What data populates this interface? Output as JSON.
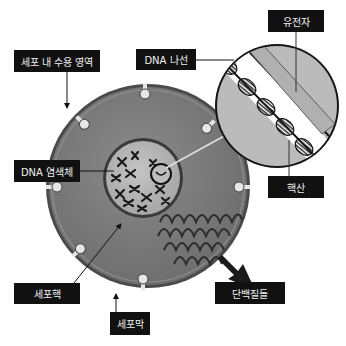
{
  "diagram": {
    "type": "cell-structure-illustration",
    "language": "ko",
    "colors": {
      "background": "#ffffff",
      "cytoplasm": "#7a7a7a",
      "membrane": "#555555",
      "nucleus": "#b4b4b4",
      "magnifier_fill": "#b9b9b9",
      "dna_band": "#ffffff",
      "label_bg": "#111111",
      "label_text": "#f0f0f0"
    },
    "labels": {
      "receptor": "세포 내 수용 영역",
      "dna_helix": "DNA 나선",
      "gene": "유전자",
      "chromosome": "DNA 염색체",
      "nucleic_acid": "핵산",
      "nucleus": "세포핵",
      "membrane": "세포막",
      "proteins": "단백질들"
    }
  }
}
